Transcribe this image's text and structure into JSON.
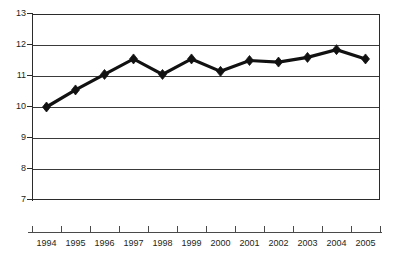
{
  "chart_data": {
    "type": "line",
    "title": "",
    "subtitle": "",
    "xlabel": "",
    "ylabel": "",
    "categories": [
      "1994",
      "1995",
      "1996",
      "1997",
      "1998",
      "1999",
      "2000",
      "2001",
      "2002",
      "2003",
      "2004",
      "2005"
    ],
    "values": [
      10.0,
      10.55,
      11.05,
      11.55,
      11.05,
      11.55,
      11.15,
      11.5,
      11.45,
      11.6,
      11.85,
      11.55
    ],
    "series": [
      {
        "name": "",
        "values": [
          10.0,
          10.55,
          11.05,
          11.55,
          11.05,
          11.55,
          11.15,
          11.5,
          11.45,
          11.6,
          11.85,
          11.55
        ]
      }
    ],
    "ylim": [
      7,
      13
    ],
    "ytick_labels": [
      "7",
      "8",
      "9",
      "10",
      "11",
      "12",
      "13"
    ],
    "ytick_values": [
      7,
      8,
      9,
      10,
      11,
      12,
      13
    ],
    "xtick_labels": [
      "1994",
      "1995",
      "1996",
      "1997",
      "1998",
      "1999",
      "2000",
      "2001",
      "2002",
      "2003",
      "2004",
      "2005"
    ],
    "grid": true,
    "grid_axis": "y",
    "legend": false,
    "legend_position": "none",
    "marker": "diamond",
    "line_color": "#111111",
    "marker_color": "#111111",
    "grid_color": "#3a3a3a",
    "axis_color": "#2b2b2b",
    "background_color": "#ffffff",
    "annotations": []
  }
}
